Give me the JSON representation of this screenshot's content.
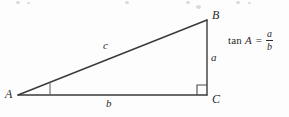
{
  "figure": {
    "background_color": "#fdfdfd",
    "stroke_color": "#3a3a3a",
    "text_color": "#2b2b2b"
  },
  "vertices": [
    {
      "id": "A",
      "label": "A",
      "x": 18,
      "y": 95,
      "angle_mark": "tick"
    },
    {
      "id": "B",
      "label": "B",
      "x": 207,
      "y": 20,
      "angle_mark": "none"
    },
    {
      "id": "C",
      "label": "C",
      "x": 207,
      "y": 95,
      "angle_mark": "right-angle-square"
    }
  ],
  "sides": [
    {
      "id": "hypotenuse",
      "label": "c",
      "from": "A",
      "to": "B"
    },
    {
      "id": "opposite",
      "label": "a",
      "from": "B",
      "to": "C"
    },
    {
      "id": "adjacent",
      "label": "b",
      "from": "A",
      "to": "C"
    }
  ],
  "formula": {
    "function_name": "tan",
    "argument": "A",
    "equals": "=",
    "numerator": "a",
    "denominator": "b",
    "plain_text": "tan A = a/b"
  },
  "top_artifacts": [
    {
      "x": 16,
      "y": 1,
      "w": 4,
      "h": 3
    },
    {
      "x": 27,
      "y": 2,
      "w": 3,
      "h": 2
    },
    {
      "x": 125,
      "y": 1,
      "w": 4,
      "h": 3
    },
    {
      "x": 186,
      "y": 1,
      "w": 4,
      "h": 3
    },
    {
      "x": 196,
      "y": 5,
      "w": 5,
      "h": 4
    },
    {
      "x": 236,
      "y": 1,
      "w": 4,
      "h": 3
    },
    {
      "x": 248,
      "y": 2,
      "w": 3,
      "h": 2
    }
  ]
}
